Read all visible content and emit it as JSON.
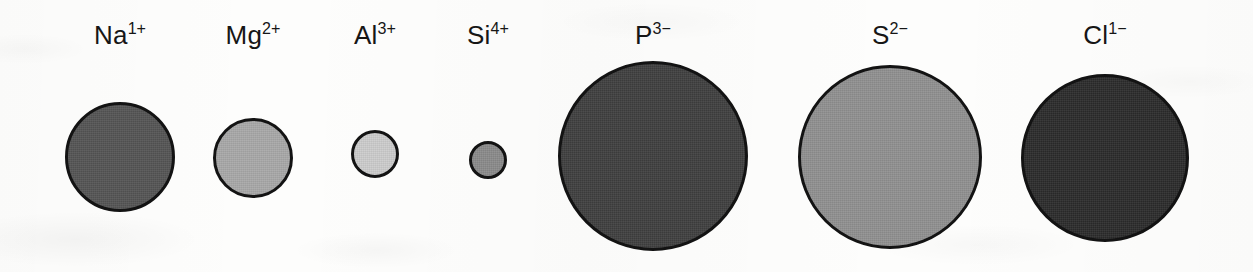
{
  "figure": {
    "width": 1253,
    "height": 272,
    "background_color": "#fdfdfc",
    "outline_color": "#131313"
  },
  "chart_data": {
    "type": "scatter",
    "subtitle": "",
    "xlabel": "",
    "ylabel": "",
    "grid": false,
    "legend": "none",
    "value_units": "pixels (rendered circle diameter, proportional to ionic radius)",
    "categories": [
      "Na1+",
      "Mg2+",
      "Al3+",
      "Si4+",
      "P3-",
      "S2-",
      "Cl1-"
    ],
    "values": [
      110,
      80,
      48,
      38,
      190,
      184,
      168
    ],
    "series": [
      {
        "name": "Rendered circle diameter (px)",
        "values": [
          110,
          80,
          48,
          38,
          190,
          184,
          168
        ]
      },
      {
        "name": "Center x (px)",
        "values": [
          120,
          253,
          375,
          488,
          653,
          890,
          1105
        ]
      },
      {
        "name": "Center y (px)",
        "values": [
          157,
          158,
          154,
          160,
          156,
          157,
          158
        ]
      }
    ],
    "annotations": [
      "Cations (Na1+, Mg2+, Al3+, Si4+) are drawn progressively smaller",
      "Anions (P3-, S2-, Cl1-) are drawn much larger than the cations"
    ]
  },
  "ions": [
    {
      "id": "sodium",
      "symbol": "Na",
      "charge": "1+",
      "label": "Na1+",
      "center_x": 120,
      "center_y": 157,
      "diameter": 110,
      "fill_color": "#555555",
      "label_y": 22
    },
    {
      "id": "magnesium",
      "symbol": "Mg",
      "charge": "2+",
      "label": "Mg2+",
      "center_x": 253,
      "center_y": 158,
      "diameter": 80,
      "fill_color": "#a9a9a9",
      "label_y": 22
    },
    {
      "id": "aluminium",
      "symbol": "Al",
      "charge": "3+",
      "label": "Al3+",
      "center_x": 375,
      "center_y": 154,
      "diameter": 48,
      "fill_color": "#cdcdcd",
      "label_y": 22
    },
    {
      "id": "silicon",
      "symbol": "Si",
      "charge": "4+",
      "label": "Si4+",
      "center_x": 488,
      "center_y": 160,
      "diameter": 38,
      "fill_color": "#8b8b8b",
      "label_y": 22
    },
    {
      "id": "phosphorus",
      "symbol": "P",
      "charge": "3−",
      "label": "P3-",
      "center_x": 653,
      "center_y": 156,
      "diameter": 190,
      "fill_color": "#404040",
      "label_y": 22
    },
    {
      "id": "sulfur",
      "symbol": "S",
      "charge": "2−",
      "label": "S2-",
      "center_x": 890,
      "center_y": 157,
      "diameter": 184,
      "fill_color": "#919191",
      "label_y": 22
    },
    {
      "id": "chlorine",
      "symbol": "Cl",
      "charge": "1−",
      "label": "Cl1-",
      "center_x": 1105,
      "center_y": 158,
      "diameter": 168,
      "fill_color": "#2c2c2c",
      "label_y": 22
    }
  ]
}
